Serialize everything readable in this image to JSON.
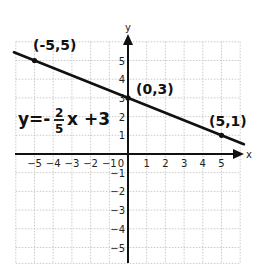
{
  "chart_data": {
    "type": "line",
    "title": "",
    "xlabel": "x",
    "ylabel": "y",
    "xlim": [
      -6,
      6
    ],
    "ylim": [
      -6,
      6
    ],
    "grid": true,
    "x_ticks": [
      "-5",
      "-4",
      "-3",
      "-2",
      "-1",
      "0",
      "1",
      "2",
      "3",
      "4",
      "5"
    ],
    "y_ticks": [
      "5",
      "4",
      "3",
      "2",
      "1",
      "-1",
      "-2",
      "-3",
      "-4",
      "-5"
    ],
    "series": [
      {
        "name": "y = -2/5 x + 3",
        "slope": -0.4,
        "intercept": 3,
        "x": [
          -5,
          0,
          5
        ],
        "y": [
          5,
          3,
          1
        ]
      }
    ],
    "annotations": {
      "point_a": "(-5,5)",
      "point_b": "(0,3)",
      "point_c": "(5,1)",
      "equation_lhs": "y=-",
      "equation_num": "2",
      "equation_den": "5",
      "equation_rhs": "x +3"
    },
    "colors": {
      "line": "#111111",
      "axis": "#111111",
      "grid": "#bdbdbd"
    }
  }
}
